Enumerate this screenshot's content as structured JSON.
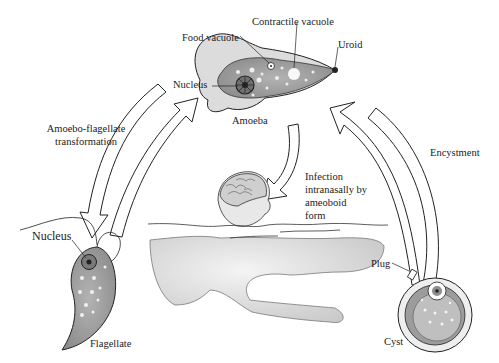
{
  "diagram": {
    "type": "life-cycle",
    "stages": {
      "amoeba": {
        "title": "Amoeba",
        "labels": {
          "contractile_vacuole": "Contractile vacuole",
          "food_vacuole": "Food vacuole",
          "uroid": "Uroid",
          "nucleus": "Nucleus"
        }
      },
      "flagellate": {
        "title": "Flagellate",
        "labels": {
          "nucleus": "Nucleus"
        }
      },
      "cyst": {
        "title": "Cyst",
        "labels": {
          "plug": "Plug"
        }
      }
    },
    "transitions": {
      "amoebo_flagellate": [
        "Amoebo-flagellate",
        "transformation"
      ],
      "infection": [
        "Infection",
        "intranasally by",
        "ameoboid",
        "form"
      ],
      "encystment": "Encystment"
    },
    "colors": {
      "cell_fill": "#9a9a9a",
      "pseudopod_fill": "#d8d8d8",
      "outline": "#222222",
      "skin": "#e6e6e6",
      "cyst_wall": "#bdbdbd"
    }
  }
}
